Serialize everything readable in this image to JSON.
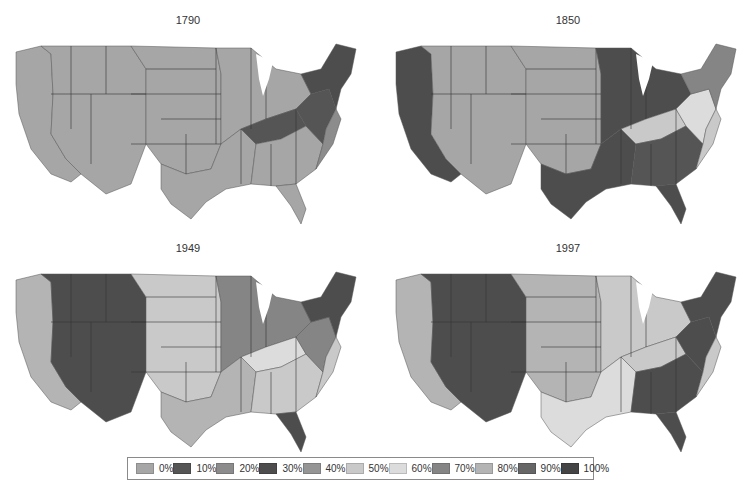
{
  "figure": {
    "panels": [
      {
        "title": "1790",
        "left": 8,
        "top": 0
      },
      {
        "title": "1850",
        "left": 388,
        "top": 0
      },
      {
        "title": "1949",
        "left": 8,
        "top": 228
      },
      {
        "title": "1997",
        "left": 388,
        "top": 228
      }
    ]
  },
  "legend": {
    "items": [
      {
        "label": "0%",
        "color": "#a6a6a6"
      },
      {
        "label": "10%",
        "color": "#555555"
      },
      {
        "label": "20%",
        "color": "#8c8c8c"
      },
      {
        "label": "30%",
        "color": "#4d4d4d"
      },
      {
        "label": "40%",
        "color": "#959595"
      },
      {
        "label": "50%",
        "color": "#c9c9c9"
      },
      {
        "label": "60%",
        "color": "#dcdcdc"
      },
      {
        "label": "70%",
        "color": "#858585"
      },
      {
        "label": "80%",
        "color": "#b4b4b4"
      },
      {
        "label": "90%",
        "color": "#666666"
      },
      {
        "label": "100%",
        "color": "#444444"
      }
    ]
  },
  "maps": {
    "1790": {
      "west": "#a6a6a6",
      "plains": "#a6a6a6",
      "midwest": "#a6a6a6",
      "south": "#a6a6a6",
      "southeast": "#a6a6a6",
      "kentucky": "#555555",
      "east": "#555555",
      "northeast": "#4d4d4d",
      "atlantic": "#8c8c8c",
      "florida": "#a6a6a6"
    },
    "1850": {
      "west": "#a6a6a6",
      "plains": "#a6a6a6",
      "midwest": "#4d4d4d",
      "south": "#4d4d4d",
      "southeast": "#555555",
      "kentucky": "#c9c9c9",
      "east": "#dcdcdc",
      "northeast": "#858585",
      "atlantic": "#c9c9c9",
      "florida": "#4d4d4d",
      "pacific": "#4d4d4d"
    },
    "1949": {
      "west": "#4d4d4d",
      "plains": "#c9c9c9",
      "midwest": "#858585",
      "south": "#b4b4b4",
      "southeast": "#c9c9c9",
      "kentucky": "#dcdcdc",
      "east": "#858585",
      "northeast": "#4d4d4d",
      "atlantic": "#c9c9c9",
      "florida": "#4d4d4d",
      "pacific": "#b4b4b4"
    },
    "1997": {
      "west": "#4d4d4d",
      "plains": "#b4b4b4",
      "midwest": "#c9c9c9",
      "south": "#dcdcdc",
      "southeast": "#4d4d4d",
      "kentucky": "#c9c9c9",
      "east": "#4d4d4d",
      "northeast": "#4d4d4d",
      "atlantic": "#c9c9c9",
      "florida": "#4d4d4d",
      "pacific": "#b4b4b4"
    }
  }
}
